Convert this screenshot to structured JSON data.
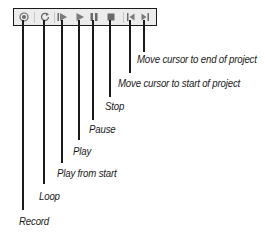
{
  "toolbar": {
    "buttons": [
      {
        "id": "record",
        "icon": "record-icon",
        "x": 23,
        "label": "Record"
      },
      {
        "id": "loop",
        "icon": "loop-icon",
        "x": 44,
        "label": "Loop"
      },
      {
        "id": "play-from-start",
        "icon": "play-from-start-icon",
        "x": 62,
        "label": "Play from start"
      },
      {
        "id": "play",
        "icon": "play-icon",
        "x": 79,
        "label": "Play"
      },
      {
        "id": "pause",
        "icon": "pause-icon",
        "x": 93,
        "label": "Pause"
      },
      {
        "id": "stop",
        "icon": "stop-icon",
        "x": 110,
        "label": "Stop"
      },
      {
        "id": "move-to-start",
        "icon": "move-cursor-to-start-icon",
        "x": 130,
        "label": "Move cursor to start of project"
      },
      {
        "id": "move-to-end",
        "icon": "move-cursor-to-end-icon",
        "x": 144,
        "label": "Move cursor to end of project"
      }
    ]
  },
  "callouts": {
    "record": "Record",
    "loop": "Loop",
    "play_from_start": "Play from start",
    "play": "Play",
    "pause": "Pause",
    "stop": "Stop",
    "move_to_start": "Move cursor to start of project",
    "move_to_end": "Move cursor to end of project"
  },
  "colors": {
    "line": "#1a1a1a",
    "toolbar_bg": "#ececec",
    "icon": "#7a7a7a"
  }
}
